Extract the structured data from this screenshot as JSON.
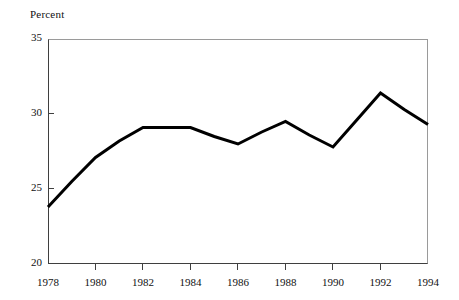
{
  "chart_data": {
    "type": "line",
    "title": "",
    "subtitle": "",
    "xlabel": "",
    "ylabel": "Percent",
    "ylim": [
      20,
      35
    ],
    "xlim": [
      1978,
      1994
    ],
    "yticks": [
      20,
      25,
      30,
      35
    ],
    "ytick_labels": [
      "20",
      "25",
      "30",
      "35"
    ],
    "xticks": [
      1978,
      1980,
      1982,
      1984,
      1986,
      1988,
      1990,
      1992,
      1994
    ],
    "xtick_labels": [
      "1978",
      "1980",
      "1982",
      "1984",
      "1986",
      "1988",
      "1990",
      "1992",
      "1994"
    ],
    "grid": false,
    "legend": false,
    "legend_position": "none",
    "line_color": "#000000",
    "line_width": 3,
    "frame_color": "#3f3f3f",
    "background_color": "#ffffff",
    "x": [
      1978,
      1979,
      1980,
      1981,
      1982,
      1983,
      1984,
      1985,
      1986,
      1987,
      1988,
      1989,
      1990,
      1991,
      1992,
      1993,
      1994
    ],
    "values": [
      23.8,
      25.5,
      27.1,
      28.2,
      29.1,
      29.1,
      29.1,
      28.5,
      28.0,
      28.8,
      29.5,
      28.6,
      27.8,
      29.6,
      31.4,
      30.3,
      29.3
    ],
    "series": [
      {
        "name": "Percent",
        "values": [
          23.8,
          25.5,
          27.1,
          28.2,
          29.1,
          29.1,
          29.1,
          28.5,
          28.0,
          28.8,
          29.5,
          28.6,
          27.8,
          29.6,
          31.4,
          30.3,
          29.3
        ]
      }
    ]
  },
  "axis": {
    "ylabel_text": "Percent"
  }
}
